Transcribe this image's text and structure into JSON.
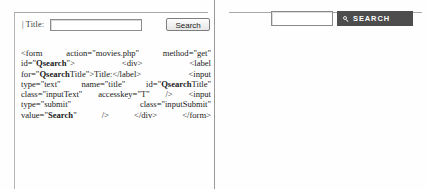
{
  "left_panel": {
    "widget": {
      "field_label": "| Title:",
      "text_input_value": "",
      "text_input_placeholder": "",
      "submit_label": "Search"
    },
    "code_lines": [
      [
        "<form",
        "action=\"movies.php\"",
        "method=\"get\""
      ],
      [
        "id=\"Qsearch\">",
        "<div>",
        "<label"
      ],
      [
        "for=\"QsearchTitle\">Title:</label>",
        "<input"
      ],
      [
        "type=\"text\"",
        "name=\"title\"",
        "id=\"QsearchTitle\""
      ],
      [
        "class=\"inputText\"",
        "accesskey=\"T\"",
        "/>",
        "<input"
      ],
      [
        "type=\"submit\"",
        "class=\"inputSubmit\""
      ],
      [
        "value=\"Search\"",
        "/>",
        "</div>",
        "</form>"
      ]
    ]
  },
  "right_panel": {
    "widget": {
      "text_input_value": "",
      "text_input_placeholder": "",
      "submit_label": "SEARCH",
      "icon": "magnifier-icon",
      "button_color": "#4d4d4d"
    },
    "code_lines": [
      [
        "<form",
        "name=\"searchform\"action",
        "="
      ],
      [
        "\"http://www.acm.org/search",
        "style = \"white-"
      ],
      [
        "space:nowrap\"onsubmit",
        "=\"return"
      ],
      [
        "liveSearchSubmit()\">",
        "<label",
        "for  ="
      ],
      [
        "\"searchGadget\" class = \"hiddenStructure\">"
      ],
      [
        "Search",
        "Site</label>",
        "<div"
      ],
      [
        "class=\"LSBox\"><input id= \"searchGadget\""
      ],
      [
        "name",
        "=\"SearchableText\"type=\"text\""
      ],
      [
        "size=\"15\"",
        "title   =",
        "\"Search",
        "Site\""
      ],
      [
        "accesskey=\"4\" class = \"visibility  visible\""
      ],
      [
        "/><input",
        "class=\"searchButton\""
      ],
      [
        "type=\"submit\"",
        "value = \"Search\"",
        "/>"
      ]
    ],
    "margin_fragments": [
      "ut",
      "e\"",
      "ut",
      "t\"",
      "el",
      "ut",
      "d\""
    ]
  }
}
